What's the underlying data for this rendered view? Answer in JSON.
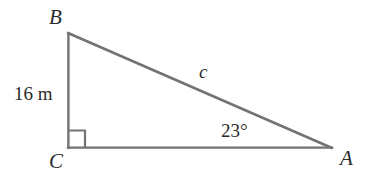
{
  "figure": {
    "type": "right-triangle-diagram",
    "background_color": "#ffffff",
    "stroke_color": "#737373",
    "text_color": "#2b2b2b",
    "width": 371,
    "height": 183
  },
  "vertices": {
    "B": {
      "label": "B",
      "x": 68,
      "y": 33
    },
    "C": {
      "label": "C",
      "x": 68,
      "y": 148
    },
    "A": {
      "label": "A",
      "x": 332,
      "y": 148
    }
  },
  "labels": {
    "vertex_b": "B",
    "vertex_c": "C",
    "vertex_a": "A",
    "hypotenuse": "c",
    "leg_bc_measure": "16 m",
    "angle_at_a": "23°"
  },
  "right_angle": {
    "at_vertex": "C",
    "marker": "square",
    "size": 17
  },
  "geometry": {
    "sides": [
      {
        "name": "BC",
        "from": "B",
        "to": "C",
        "label": "16 m",
        "type": "vertical-leg"
      },
      {
        "name": "CA",
        "from": "C",
        "to": "A",
        "label": "",
        "type": "horizontal-leg"
      },
      {
        "name": "AB",
        "from": "A",
        "to": "B",
        "label": "c",
        "type": "hypotenuse"
      }
    ],
    "angles": [
      {
        "at": "A",
        "label": "23°",
        "value": 23,
        "unit": "degrees"
      },
      {
        "at": "C",
        "label": "",
        "value": 90,
        "unit": "degrees"
      }
    ]
  }
}
